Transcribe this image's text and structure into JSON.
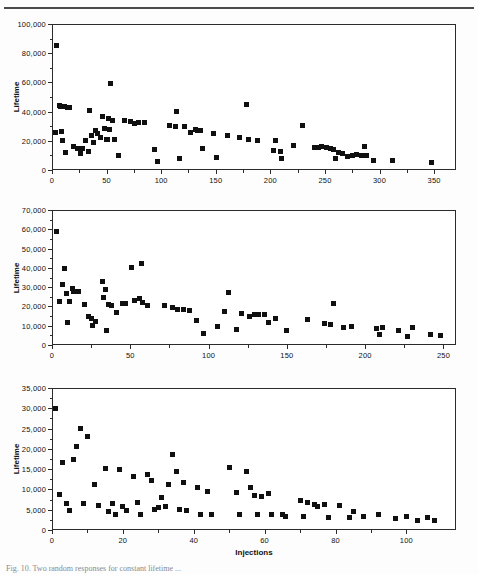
{
  "figure": {
    "panels_count": 3,
    "caption_partial": "Fig. 10. Two random responses for constant lifetime ..."
  },
  "chart_data": [
    {
      "type": "scatter",
      "panel": "(a)",
      "title": "",
      "xlabel": "",
      "ylabel": "Lifetime",
      "xlim": [
        0,
        370
      ],
      "ylim": [
        0,
        100000
      ],
      "xticks": [
        0,
        50,
        100,
        150,
        200,
        250,
        300,
        350
      ],
      "yticks": [
        0,
        20000,
        40000,
        60000,
        80000,
        100000
      ],
      "ytick_labels": [
        "0",
        "20,000",
        "40,000",
        "60,000",
        "80,000",
        "100,000"
      ],
      "xtick_labels": [
        "0",
        "50",
        "100",
        "150",
        "200",
        "250",
        "300",
        "350"
      ],
      "grid": false,
      "marker": "square",
      "marker_color": "#101010",
      "x": [
        4,
        3,
        7,
        8,
        9,
        10,
        11,
        12,
        14,
        16,
        20,
        23,
        26,
        28,
        31,
        33,
        34,
        36,
        38,
        40,
        42,
        44,
        46,
        48,
        50,
        51,
        52,
        53,
        54,
        55,
        57,
        61,
        66,
        72,
        76,
        79,
        85,
        94,
        97,
        108,
        113,
        114,
        117,
        121,
        127,
        131,
        133,
        136,
        138,
        148,
        151,
        161,
        172,
        178,
        180,
        188,
        203,
        205,
        209,
        210,
        221,
        229,
        240,
        244,
        247,
        251,
        255,
        258,
        260,
        262,
        266,
        271,
        275,
        279,
        283,
        286,
        288,
        294,
        312,
        348
      ],
      "y": [
        85500,
        25800,
        44500,
        43800,
        26200,
        20300,
        43200,
        11800,
        42600,
        42500,
        16100,
        15000,
        11300,
        14500,
        20400,
        13000,
        40800,
        23800,
        18500,
        26800,
        25000,
        22600,
        36800,
        28300,
        21000,
        20800,
        35400,
        27400,
        59000,
        34200,
        21200,
        9700,
        34000,
        33000,
        32000,
        32600,
        32600,
        13700,
        6000,
        30200,
        29900,
        40000,
        7600,
        29700,
        26000,
        27500,
        27200,
        26800,
        14600,
        25200,
        8500,
        23700,
        22300,
        44700,
        21000,
        20200,
        13600,
        19900,
        12400,
        7700,
        17000,
        30500,
        15200,
        15600,
        15800,
        15100,
        14700,
        14200,
        8100,
        11900,
        11300,
        9500,
        9900,
        10300,
        9600,
        15900,
        10200,
        6700,
        6500,
        4800
      ]
    },
    {
      "type": "scatter",
      "panel": "(b)",
      "title": "",
      "xlabel": "",
      "ylabel": "Lifetime",
      "xlim": [
        0,
        258
      ],
      "ylim": [
        0,
        70000
      ],
      "xticks": [
        0,
        50,
        100,
        150,
        200,
        250
      ],
      "yticks": [
        0,
        10000,
        20000,
        30000,
        40000,
        50000,
        60000,
        70000
      ],
      "ytick_labels": [
        "0",
        "10,000",
        "20,000",
        "30,000",
        "40,000",
        "50,000",
        "60,000",
        "70,000"
      ],
      "xtick_labels": [
        "0",
        "50",
        "100",
        "150",
        "200",
        "250"
      ],
      "grid": false,
      "marker": "square",
      "marker_color": "#101010",
      "x": [
        3,
        5,
        7,
        8,
        9,
        10,
        11,
        13,
        14,
        17,
        21,
        23,
        25,
        26,
        28,
        32,
        33,
        34,
        35,
        36,
        38,
        41,
        45,
        47,
        51,
        53,
        56,
        57,
        58,
        61,
        72,
        77,
        80,
        84,
        88,
        92,
        97,
        106,
        110,
        113,
        118,
        121,
        126,
        129,
        132,
        136,
        138,
        143,
        150,
        163,
        174,
        178,
        180,
        186,
        191,
        207,
        209,
        211,
        221,
        227,
        230,
        242,
        248
      ],
      "y": [
        58600,
        22800,
        31200,
        39700,
        26800,
        11500,
        22600,
        29200,
        27800,
        27800,
        20800,
        15000,
        13700,
        10000,
        12300,
        33000,
        24400,
        29000,
        7700,
        21000,
        20700,
        16800,
        21500,
        21400,
        40400,
        23000,
        24000,
        42200,
        21800,
        20600,
        20300,
        19400,
        18600,
        18400,
        17900,
        12800,
        6200,
        9800,
        17600,
        27000,
        8000,
        16100,
        15000,
        15600,
        15600,
        15900,
        11800,
        13500,
        7700,
        13100,
        11300,
        10700,
        21400,
        9000,
        9400,
        8600,
        5200,
        9000,
        7700,
        4600,
        8900,
        5600,
        4700
      ]
    },
    {
      "type": "scatter",
      "panel": "(c)",
      "title": "",
      "xlabel": "Injections",
      "ylabel": "Lifetime",
      "xlim": [
        0,
        114
      ],
      "ylim": [
        0,
        35000
      ],
      "xticks": [
        0,
        20,
        40,
        60,
        80,
        100
      ],
      "yticks": [
        0,
        5000,
        10000,
        15000,
        20000,
        25000,
        30000,
        35000
      ],
      "ytick_labels": [
        "0",
        "5,000",
        "10,000",
        "15,000",
        "20,000",
        "25,000",
        "30,000",
        "35,000"
      ],
      "xtick_labels": [
        "0",
        "20",
        "40",
        "60",
        "80",
        "100"
      ],
      "grid": false,
      "marker": "square",
      "marker_color": "#101010",
      "x": [
        1,
        2,
        3,
        4,
        5,
        6,
        7,
        8,
        9,
        10,
        12,
        13,
        15,
        16,
        17,
        18,
        19,
        20,
        21,
        23,
        24,
        25,
        27,
        28,
        29,
        30,
        31,
        32,
        33,
        34,
        35,
        36,
        37,
        38,
        41,
        42,
        44,
        45,
        50,
        52,
        53,
        55,
        56,
        57,
        58,
        59,
        61,
        62,
        65,
        66,
        70,
        71,
        72,
        74,
        75,
        77,
        78,
        81,
        84,
        85,
        88,
        92,
        97,
        100,
        103,
        106,
        108
      ],
      "y": [
        29900,
        8700,
        16600,
        6600,
        4800,
        17300,
        20600,
        24900,
        6500,
        23100,
        11100,
        6000,
        15100,
        4500,
        6600,
        3700,
        14900,
        5800,
        4700,
        13200,
        6800,
        3800,
        13800,
        12100,
        5100,
        5600,
        8100,
        5700,
        11200,
        18700,
        14500,
        5100,
        11700,
        4800,
        10400,
        3900,
        9400,
        3900,
        15300,
        9300,
        3700,
        14300,
        10500,
        8400,
        3900,
        8200,
        9100,
        3700,
        3800,
        3400,
        7200,
        3400,
        6900,
        6300,
        5800,
        6200,
        3100,
        6100,
        3000,
        4600,
        3400,
        3700,
        2800,
        3400,
        2300,
        3200,
        2400
      ]
    }
  ]
}
